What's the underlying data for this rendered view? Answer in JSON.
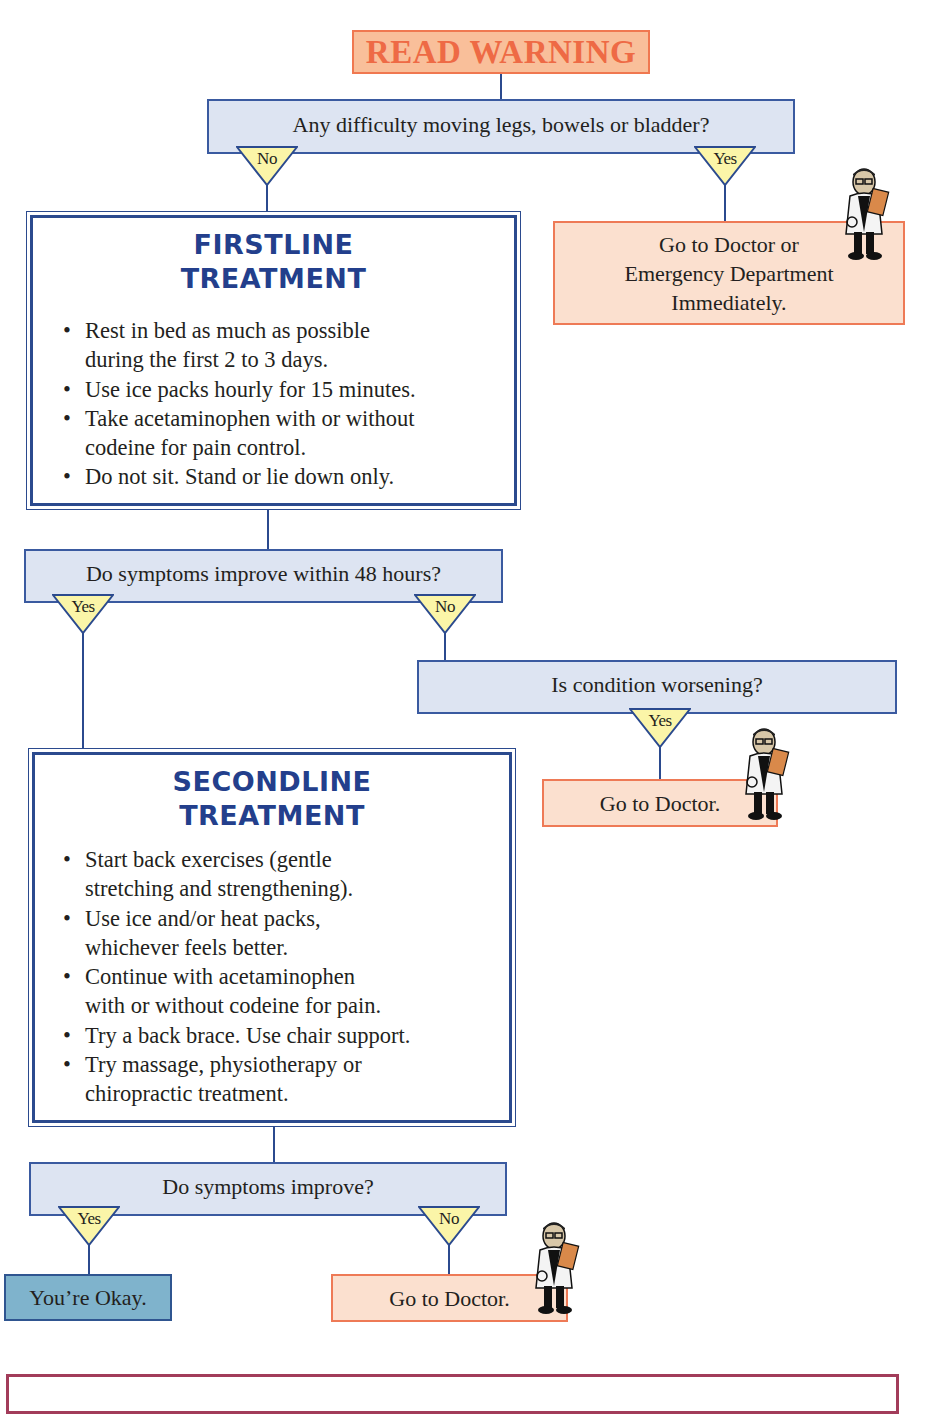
{
  "flowchart": {
    "warning": {
      "label": "READ WARNING",
      "color": "#ee6a45",
      "fill": "#f9bf9a"
    },
    "q1": {
      "text": "Any difficulty moving legs, bowels or bladder?",
      "no_label": "No",
      "yes_label": "Yes"
    },
    "emergency": {
      "lines": [
        "Go to Doctor or",
        "Emergency Department",
        "Immediately."
      ]
    },
    "firstline": {
      "title_line1": "FIRSTLINE",
      "title_line2": "TREATMENT",
      "bullets": [
        {
          "line1": "Rest in bed as much as possible",
          "line2": "during the first 2 to 3 days."
        },
        {
          "line1": "Use ice packs hourly for 15 minutes.",
          "line2": ""
        },
        {
          "line1": "Take acetaminophen with or without",
          "line2": "codeine for pain control."
        },
        {
          "line1": "Do not sit. Stand or lie down only.",
          "line2": ""
        }
      ]
    },
    "q2": {
      "text": "Do symptoms improve within 48 hours?",
      "yes_label": "Yes",
      "no_label": "No"
    },
    "q3": {
      "text": "Is condition worsening?",
      "yes_label": "Yes"
    },
    "doctor1": {
      "text": "Go to Doctor."
    },
    "secondline": {
      "title_line1": "SECONDLINE",
      "title_line2": "TREATMENT",
      "bullets": [
        {
          "line1": "Start back exercises (gentle",
          "line2": "stretching and strengthening)."
        },
        {
          "line1": "Use ice and/or heat packs,",
          "line2": "whichever feels better."
        },
        {
          "line1": "Continue with acetaminophen",
          "line2": "with or without codeine for pain."
        },
        {
          "line1": "Try a back brace. Use chair support.",
          "line2": ""
        },
        {
          "line1": "Try massage, physiotherapy or",
          "line2": "chiropractic treatment."
        }
      ]
    },
    "q4": {
      "text": "Do symptoms improve?",
      "yes_label": "Yes",
      "no_label": "No"
    },
    "okay": {
      "text": "You’re Okay."
    },
    "doctor2": {
      "text": "Go to Doctor."
    },
    "icons": {
      "doctor": "doctor-with-clipboard-illustration",
      "decision_marker": "yellow-down-triangle"
    },
    "colors": {
      "line": "#2b4a8e",
      "question_fill": "#dde4f2",
      "action_fill": "#fbe0cf",
      "action_border": "#ee7a56",
      "okay_fill": "#7fb3cc",
      "triangle_fill": "#fbf5a8",
      "title_blue": "#233f8c",
      "footer_border": "#a23c5a"
    }
  }
}
